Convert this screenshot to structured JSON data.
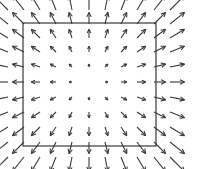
{
  "diagram": {
    "type": "vector-field",
    "grid": {
      "cols": 11,
      "rows": 11,
      "x_positions": [
        8,
        24,
        40,
        56,
        72,
        89,
        105,
        121,
        137,
        154,
        170
      ],
      "y_positions": [
        10,
        24,
        38,
        52,
        67,
        82,
        97,
        112,
        127,
        142,
        157
      ],
      "center_col": 5,
      "center_row": 5
    },
    "arrow_scale": 2.9,
    "square": {
      "x": 23,
      "y": 23,
      "width": 133,
      "height": 123
    },
    "colors": {
      "arrow": "#3a3a3a",
      "square": "#555555",
      "background": "#ffffff"
    }
  }
}
